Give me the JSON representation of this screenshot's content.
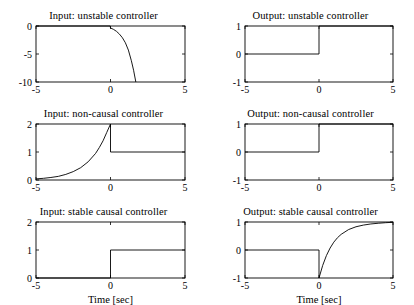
{
  "figure": {
    "width": 414,
    "height": 302,
    "background": "#ffffff",
    "line_color": "#000000",
    "xlabel": "Time [sec]"
  },
  "chart_data": [
    {
      "type": "line",
      "title": "Input: unstable controller",
      "xlabel": "",
      "ylabel": "",
      "xlim": [
        -5,
        5
      ],
      "ylim": [
        -10,
        0
      ],
      "xticks": [
        -5,
        0,
        5
      ],
      "xticklabels": [
        "-5",
        "0",
        "5"
      ],
      "yticks": [
        0,
        -5,
        -10
      ],
      "yticklabels": [
        "0",
        "-5",
        "-10"
      ],
      "grid": false,
      "legend": "none",
      "series": [
        {
          "name": "input",
          "description": "zero for t<0, then a growing negative exponential that leaves the axis near t=1.7",
          "x": [
            -5,
            -0.02,
            0,
            0.2,
            0.4,
            0.6,
            0.8,
            1.0,
            1.2,
            1.4,
            1.55,
            1.7
          ],
          "y": [
            0,
            0,
            -0.35,
            -0.6,
            -0.95,
            -1.45,
            -2.1,
            -3.0,
            -4.3,
            -6.2,
            -7.9,
            -10
          ]
        }
      ]
    },
    {
      "type": "line",
      "title": "Output: unstable controller",
      "xlabel": "",
      "ylabel": "",
      "xlim": [
        -5,
        5
      ],
      "ylim": [
        -1,
        1
      ],
      "xticks": [
        -5,
        0,
        5
      ],
      "xticklabels": [
        "-5",
        "0",
        "5"
      ],
      "yticks": [
        1,
        0,
        -1
      ],
      "yticklabels": [
        "1",
        "0",
        "-1"
      ],
      "grid": false,
      "legend": "none",
      "series": [
        {
          "name": "output",
          "description": "unit step at t=0 from 0 to 1",
          "x": [
            -5,
            0,
            0,
            5
          ],
          "y": [
            0,
            0,
            1,
            1
          ]
        }
      ]
    },
    {
      "type": "line",
      "title": "Input: non-causal controller",
      "xlabel": "",
      "ylabel": "",
      "xlim": [
        -5,
        5
      ],
      "ylim": [
        0,
        2
      ],
      "xticks": [
        -5,
        0,
        5
      ],
      "xticklabels": [
        "-5",
        "0",
        "5"
      ],
      "yticks": [
        0,
        1,
        2
      ],
      "yticklabels": [
        "0",
        "1",
        "2"
      ],
      "grid": false,
      "legend": "none",
      "series": [
        {
          "name": "input",
          "description": "growing exponential from about 0.04 at t=-5 up to 2 at t=0, then constant 1 for t>0",
          "x": [
            -5,
            -4.5,
            -4,
            -3.5,
            -3,
            -2.5,
            -2,
            -1.5,
            -1,
            -0.75,
            -0.5,
            -0.25,
            0,
            0,
            5
          ],
          "y": [
            0.04,
            0.06,
            0.09,
            0.13,
            0.2,
            0.3,
            0.44,
            0.65,
            0.95,
            1.16,
            1.4,
            1.7,
            2.0,
            1.0,
            1.0
          ]
        }
      ]
    },
    {
      "type": "line",
      "title": "Output: non-causal controller",
      "xlabel": "",
      "ylabel": "",
      "xlim": [
        -5,
        5
      ],
      "ylim": [
        -1,
        1
      ],
      "xticks": [
        -5,
        0,
        5
      ],
      "xticklabels": [
        "-5",
        "0",
        "5"
      ],
      "yticks": [
        1,
        0,
        -1
      ],
      "yticklabels": [
        "1",
        "0",
        "-1"
      ],
      "grid": false,
      "legend": "none",
      "series": [
        {
          "name": "output",
          "description": "unit step at t=0 from 0 to 1",
          "x": [
            -5,
            0,
            0,
            5
          ],
          "y": [
            0,
            0,
            1,
            1
          ]
        }
      ]
    },
    {
      "type": "line",
      "title": "Input: stable causal controller",
      "xlabel": "Time [sec]",
      "ylabel": "",
      "xlim": [
        -5,
        5
      ],
      "ylim": [
        0,
        2
      ],
      "xticks": [
        -5,
        0,
        5
      ],
      "xticklabels": [
        "-5",
        "0",
        "5"
      ],
      "yticks": [
        0,
        1,
        2
      ],
      "yticklabels": [
        "0",
        "1",
        "2"
      ],
      "grid": false,
      "legend": "none",
      "series": [
        {
          "name": "input",
          "description": "zero for t<0, unit step to 1 at t=0",
          "x": [
            -5,
            0,
            0,
            5
          ],
          "y": [
            0,
            0,
            1,
            1
          ]
        }
      ]
    },
    {
      "type": "line",
      "title": "Output: stable causal controller",
      "xlabel": "Time [sec]",
      "ylabel": "",
      "xlim": [
        -5,
        5
      ],
      "ylim": [
        -1,
        1
      ],
      "xticks": [
        -5,
        0,
        5
      ],
      "xticklabels": [
        "-5",
        "0",
        "5"
      ],
      "yticks": [
        1,
        0,
        -1
      ],
      "yticklabels": [
        "1",
        "0",
        "-1"
      ],
      "grid": false,
      "legend": "none",
      "series": [
        {
          "name": "output",
          "description": "zero for t<0, drops to -1 at t=0 then rises exponentially toward 1",
          "x": [
            -5,
            0,
            0,
            0.25,
            0.5,
            0.75,
            1.0,
            1.25,
            1.5,
            2.0,
            2.5,
            3.0,
            3.5,
            4.0,
            4.5,
            5.0
          ],
          "y": [
            0,
            0,
            -1.0,
            -0.55,
            -0.2,
            0.07,
            0.28,
            0.44,
            0.56,
            0.73,
            0.83,
            0.89,
            0.93,
            0.955,
            0.975,
            0.99
          ]
        }
      ]
    }
  ]
}
